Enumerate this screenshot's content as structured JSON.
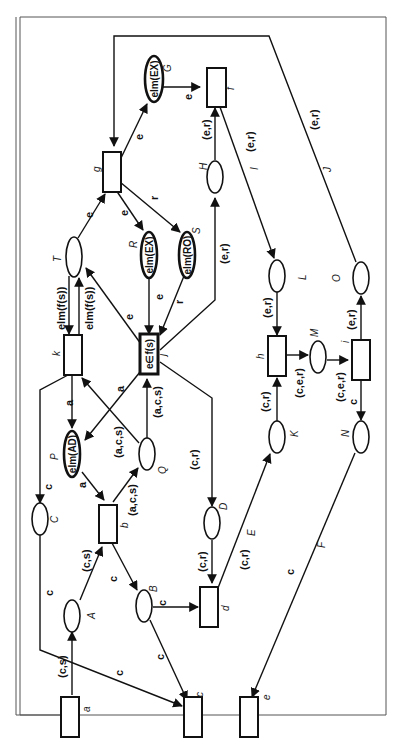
{
  "diagram": {
    "type": "petri-net",
    "orientation": "rotated-90-ccw",
    "transitions": [
      {
        "id": "a",
        "label": "a"
      },
      {
        "id": "b",
        "label": "b"
      },
      {
        "id": "c",
        "label": "c"
      },
      {
        "id": "d",
        "label": "d"
      },
      {
        "id": "e",
        "label": "e"
      },
      {
        "id": "f",
        "label": "f"
      },
      {
        "id": "g",
        "label": "g"
      },
      {
        "id": "h",
        "label": "h"
      },
      {
        "id": "i",
        "label": "i"
      },
      {
        "id": "j",
        "label": "j",
        "inner": "e∈f(s)"
      },
      {
        "id": "k",
        "label": "k"
      }
    ],
    "places": [
      {
        "id": "A",
        "label": "A"
      },
      {
        "id": "B",
        "label": "B"
      },
      {
        "id": "C",
        "label": "C"
      },
      {
        "id": "D",
        "label": "D"
      },
      {
        "id": "E",
        "label": "E"
      },
      {
        "id": "F",
        "label": "F"
      },
      {
        "id": "G",
        "label": "G",
        "inner": "elm(EX)"
      },
      {
        "id": "H",
        "label": "H"
      },
      {
        "id": "I",
        "label": "I"
      },
      {
        "id": "J",
        "label": "J"
      },
      {
        "id": "K",
        "label": "K"
      },
      {
        "id": "L",
        "label": "L"
      },
      {
        "id": "M",
        "label": "M"
      },
      {
        "id": "N",
        "label": "N"
      },
      {
        "id": "O",
        "label": "O"
      },
      {
        "id": "P",
        "label": "P",
        "inner": "elm(AD)"
      },
      {
        "id": "Q",
        "label": "Q"
      },
      {
        "id": "R",
        "label": "R",
        "inner": "elm(EX)"
      },
      {
        "id": "S",
        "label": "S",
        "inner": "elm(RO)"
      },
      {
        "id": "T",
        "label": "T"
      }
    ],
    "arc_labels": {
      "a_A": "(c,s)",
      "A_b": "(c,s)",
      "b_B": "c",
      "B_c": "c",
      "B_d": "c",
      "k_C": "c",
      "C_c": "c",
      "b_Q": "(a,c,s)",
      "Q_k": "(a,c,s)",
      "Q_j": "(a,c,s)",
      "k_P": "a",
      "j_P": "a",
      "P_b": "a",
      "j_D": "(c,r)",
      "D_d": "(c,r)",
      "d_K": "(c,r)",
      "K_h": "(c,r)",
      "h_M": "(c,e,r)",
      "M_i": "(c,e,r)",
      "i_N": "c",
      "N_e": "c",
      "L_h": "(e,r)",
      "i_O": "(e,r)",
      "O_g": "(e,r)",
      "f_L": "(e,r)",
      "j_H": "(e,r)",
      "H_f": "(e,r)",
      "G_f": "e",
      "g_G": "e",
      "g_R": "e",
      "g_S": "r",
      "R_j": "e",
      "S_j": "r",
      "T_g": "e",
      "j_T": "e",
      "T_k": "elm(f(s))",
      "k_T": "elm(f(s))"
    }
  }
}
